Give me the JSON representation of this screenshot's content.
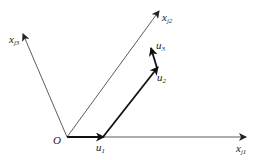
{
  "diagram": {
    "origin_label": "O",
    "axes": [
      {
        "name": "x",
        "sub": "j1"
      },
      {
        "name": "x",
        "sub": "j2"
      },
      {
        "name": "x",
        "sub": "j3"
      }
    ],
    "vectors": [
      {
        "name": "u",
        "sub": "1"
      },
      {
        "name": "u",
        "sub": "2"
      },
      {
        "name": "u",
        "sub": "3"
      }
    ],
    "colors": {
      "axis": "#333333",
      "vector": "#111111",
      "background": "#ffffff"
    }
  }
}
